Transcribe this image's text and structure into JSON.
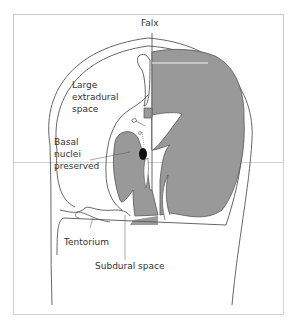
{
  "diagram": {
    "type": "anatomical-cross-section",
    "colors": {
      "brain_fill": "#999999",
      "outline": "#555555",
      "frame": "#bbbbbb",
      "nucleus": "#111111"
    },
    "labels": {
      "falx": "Falx",
      "extradural_1": "Large",
      "extradural_2": "extradural",
      "extradural_3": "space",
      "basal_1": "Basal",
      "basal_2": "nuclei",
      "basal_3": "preserved",
      "tentorium": "Tentorium",
      "subdural": "Subdural space"
    }
  }
}
